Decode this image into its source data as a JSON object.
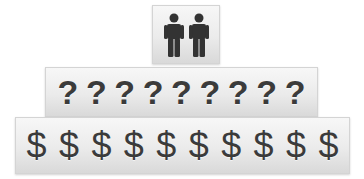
{
  "pyramid": {
    "top": {
      "icon": "two-people-icon",
      "count": 2
    },
    "middle": {
      "symbols": [
        "?",
        "?",
        "?",
        "?",
        "?",
        "?",
        "?",
        "?",
        "?"
      ]
    },
    "bottom": {
      "symbols": [
        "$",
        "$",
        "$",
        "$",
        "$",
        "$",
        "$",
        "$",
        "$",
        "$"
      ]
    }
  },
  "colors": {
    "glyph": "#3b3b3b",
    "box_light": "#f7f7f7",
    "box_dark": "#d9d9d9"
  }
}
